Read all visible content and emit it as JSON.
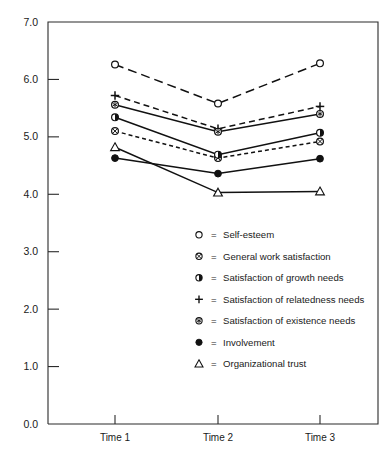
{
  "chart_data": {
    "type": "line",
    "title": "",
    "subtitle": "",
    "xlabel": "",
    "ylabel": "",
    "categories": [
      "Time 1",
      "Time 2",
      "Time 3"
    ],
    "x_tick_labels": [
      "Time 1",
      "Time 2",
      "Time 3"
    ],
    "y_tick_labels": [
      "0.0",
      "1.0",
      "2.0",
      "3.0",
      "4.0",
      "5.0",
      "6.0",
      "7.0"
    ],
    "y_tick_values": [
      0.0,
      1.0,
      2.0,
      3.0,
      4.0,
      5.0,
      6.0,
      7.0
    ],
    "ylim": [
      0.0,
      7.0
    ],
    "grid": false,
    "legend_position": "center",
    "series": [
      {
        "name": "Self-esteem",
        "marker": "open-circle",
        "linestyle": "long-dash",
        "values": [
          6.26,
          5.58,
          6.28
        ]
      },
      {
        "name": "General work satisfaction",
        "marker": "circle-cross",
        "linestyle": "short-dash",
        "values": [
          5.1,
          4.63,
          4.92
        ]
      },
      {
        "name": "Satisfaction of growth needs",
        "marker": "half-filled-circle",
        "linestyle": "solid",
        "values": [
          5.34,
          4.69,
          5.07
        ]
      },
      {
        "name": "Satisfaction of relatedness needs",
        "marker": "plus",
        "linestyle": "medium-dash",
        "values": [
          5.72,
          5.14,
          5.53
        ]
      },
      {
        "name": "Satisfaction of existence needs",
        "marker": "circle-star",
        "linestyle": "solid",
        "values": [
          5.56,
          5.09,
          5.4
        ]
      },
      {
        "name": "Involvement",
        "marker": "filled-circle",
        "linestyle": "solid",
        "values": [
          4.63,
          4.36,
          4.62
        ]
      },
      {
        "name": "Organizational trust",
        "marker": "open-triangle",
        "linestyle": "solid",
        "values": [
          4.82,
          4.03,
          4.05
        ]
      }
    ]
  },
  "legend": {
    "equals": "=",
    "items": [
      {
        "marker": "open-circle",
        "label": "Self-esteem"
      },
      {
        "marker": "circle-cross",
        "label": "General work satisfaction"
      },
      {
        "marker": "half-filled-circle",
        "label": "Satisfaction of growth needs"
      },
      {
        "marker": "plus",
        "label": "Satisfaction of relatedness needs"
      },
      {
        "marker": "circle-star",
        "label": "Satisfaction of existence needs"
      },
      {
        "marker": "filled-circle",
        "label": "Involvement"
      },
      {
        "marker": "open-triangle",
        "label": "Organizational trust"
      }
    ]
  },
  "colors": {
    "ink": "#111111",
    "axis": "#2b2b2b",
    "background": "#ffffff"
  }
}
